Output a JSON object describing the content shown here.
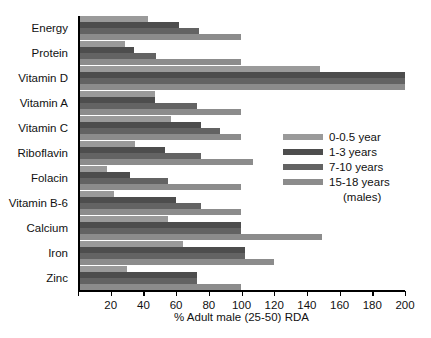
{
  "chart_data": {
    "type": "bar",
    "orientation": "horizontal",
    "title": "",
    "xlabel": "% Adult male (25-50) RDA",
    "ylabel": "",
    "xlim": [
      0,
      200
    ],
    "xticks": [
      0,
      20,
      40,
      60,
      80,
      100,
      120,
      140,
      160,
      180,
      200
    ],
    "xtick_labels": [
      "",
      "20",
      "40",
      "60",
      "80",
      "100",
      "120",
      "140",
      "160",
      "180",
      "200"
    ],
    "grid": false,
    "legend_position": "center-right",
    "categories": [
      "Energy",
      "Protein",
      "Vitamin D",
      "Vitamin A",
      "Vitamin C",
      "Riboflavin",
      "Folacin",
      "Vitamin B-6",
      "Calcium",
      "Iron",
      "Zinc"
    ],
    "series": [
      {
        "name": "0-0.5 year",
        "color": "#9a9a9a",
        "values": [
          43,
          29,
          148,
          47,
          57,
          35,
          18,
          22,
          55,
          64,
          30
        ]
      },
      {
        "name": "1-3 years",
        "color": "#4d4d4d",
        "values": [
          62,
          34,
          200,
          47,
          75,
          53,
          32,
          60,
          100,
          102,
          73
        ]
      },
      {
        "name": "7-10 years",
        "color": "#636363",
        "values": [
          74,
          48,
          200,
          73,
          87,
          75,
          55,
          75,
          100,
          102,
          73
        ]
      },
      {
        "name": "15-18 years (males)",
        "color": "#8c8c8c",
        "values": [
          100,
          100,
          200,
          100,
          100,
          107,
          100,
          100,
          149,
          120,
          100
        ]
      }
    ]
  },
  "legend": {
    "entries": [
      {
        "label": "0-0.5 year",
        "color": "#9a9a9a"
      },
      {
        "label": "1-3 years",
        "color": "#4d4d4d"
      },
      {
        "label": "7-10 years",
        "color": "#636363"
      },
      {
        "label": "15-18 years",
        "color": "#8c8c8c"
      }
    ],
    "sublabel": "(males)"
  }
}
